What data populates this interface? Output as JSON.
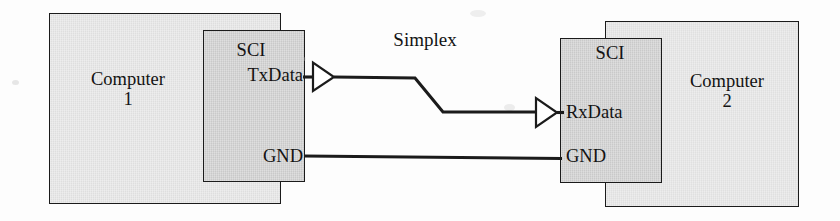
{
  "diagram": {
    "connection_label": "Simplex",
    "colors": {
      "computer_box_fill": "#e4e4e4",
      "sci_box_fill": "#cdcdcd",
      "stroke": "#1b1b1b",
      "text": "#131313",
      "page_background": "#fdfdfd"
    },
    "nodes": {
      "computer1": {
        "label": "Computer",
        "index": "1",
        "sci": {
          "title": "SCI",
          "pins": [
            "TxData",
            "GND"
          ]
        }
      },
      "computer2": {
        "label": "Computer",
        "index": "2",
        "sci": {
          "title": "SCI",
          "pins": [
            "RxData",
            "GND"
          ]
        }
      }
    },
    "signals": [
      {
        "name": "data",
        "from": "Computer 1 SCI TxData",
        "to": "Computer 2 SCI RxData",
        "buffered": true,
        "direction": "left-to-right"
      },
      {
        "name": "ground",
        "from": "Computer 1 SCI GND",
        "to": "Computer 2 SCI GND",
        "buffered": false,
        "direction": "bidirectional"
      }
    ],
    "icons": {
      "tx_buffer": "buffer-triangle-icon",
      "rx_buffer": "buffer-triangle-icon"
    }
  }
}
